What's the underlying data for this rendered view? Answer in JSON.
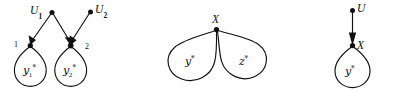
{
  "figure": {
    "caption": "",
    "background_color": "#ffffff",
    "ink_color": "#111111",
    "panels": [
      {
        "id": "panel-left",
        "exogenous_nodes": [
          {
            "id": "U1",
            "label": "U",
            "subscript": "1"
          },
          {
            "id": "U2",
            "label": "U",
            "subscript": "2"
          }
        ],
        "endogenous_nodes": [
          {
            "id": "node-1",
            "index_label": "1",
            "loop_label": "y",
            "loop_subscript": "1",
            "loop_star": "*"
          },
          {
            "id": "node-2",
            "index_label": "2",
            "loop_label": "y",
            "loop_subscript": "2",
            "loop_star": "*"
          }
        ],
        "edges": [
          {
            "from": "U1",
            "to": "node-1"
          },
          {
            "from": "U1",
            "to": "node-2"
          },
          {
            "from": "U2",
            "to": "node-2"
          }
        ]
      },
      {
        "id": "panel-middle",
        "endogenous_nodes": [
          {
            "id": "X",
            "label": "X"
          }
        ],
        "loops": [
          {
            "id": "loop-y",
            "label": "y",
            "star": "*"
          },
          {
            "id": "loop-z",
            "label": "z",
            "star": "*"
          }
        ]
      },
      {
        "id": "panel-right",
        "exogenous_nodes": [
          {
            "id": "U",
            "label": "U"
          }
        ],
        "endogenous_nodes": [
          {
            "id": "X",
            "label": "X"
          }
        ],
        "loops": [
          {
            "id": "loop-y",
            "label": "y",
            "star": "*"
          }
        ],
        "edges": [
          {
            "from": "U",
            "to": "X"
          }
        ]
      }
    ]
  }
}
